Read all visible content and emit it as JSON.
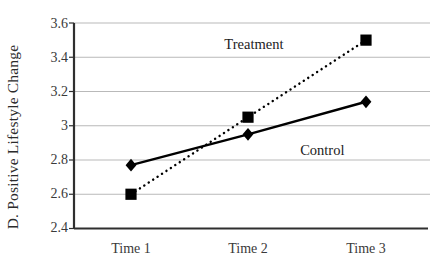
{
  "chart_data": {
    "type": "line",
    "title": "",
    "xlabel": "",
    "ylabel": "D. Positive Lifestyle Change",
    "categories": [
      "Time 1",
      "Time 2",
      "Time 3"
    ],
    "ylim": [
      2.4,
      3.6
    ],
    "yticks": [
      "2.4",
      "2.6",
      "2.8",
      "3",
      "3.2",
      "3.4",
      "3.6"
    ],
    "ytick_values": [
      2.4,
      2.6,
      2.8,
      3.0,
      3.2,
      3.4,
      3.6
    ],
    "grid": "horizontal",
    "legend_position": "inline-annotations",
    "series": [
      {
        "name": "Treatment",
        "values": [
          2.6,
          3.05,
          3.5
        ],
        "marker": "square",
        "line_style": "dotted",
        "color": "#000000"
      },
      {
        "name": "Control",
        "values": [
          2.77,
          2.95,
          3.14
        ],
        "marker": "diamond",
        "line_style": "solid",
        "color": "#000000"
      }
    ],
    "annotations": [
      {
        "text": "Treatment",
        "x": 2.05,
        "y": 3.48
      },
      {
        "text": "Control",
        "x": 2.63,
        "y": 2.86
      }
    ]
  },
  "axes": {
    "axis_color": "#2f2f2f",
    "grid_color": "#b9b9b9"
  }
}
